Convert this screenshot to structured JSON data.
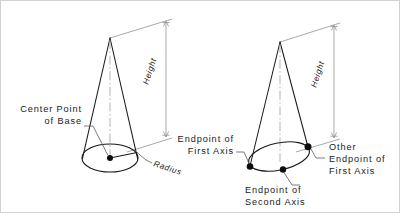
{
  "figure": {
    "type": "technical-line-diagram",
    "background_color": "#ffffff",
    "line_color": "#1a1a1a",
    "dimension_line_color": "#9a9a9a",
    "leader_line_color": "#5a5a5a",
    "frame_color": "#d2d2d2"
  },
  "left_cone": {
    "name": "cone-by-center-and-radius",
    "labels": {
      "height": "Height",
      "radius": "Radius",
      "center_point_line1": "Center Point",
      "center_point_line2": "of Base"
    }
  },
  "right_cone": {
    "name": "cone-by-elliptical-base-axes",
    "labels": {
      "height": "Height",
      "first_axis_endpoint_line1": "Endpoint of",
      "first_axis_endpoint_line2": "First Axis",
      "other_first_axis_endpoint_line1": "Other",
      "other_first_axis_endpoint_line2": "Endpoint of",
      "other_first_axis_endpoint_line3": "First Axis",
      "second_axis_endpoint_line1": "Endpoint of",
      "second_axis_endpoint_line2": "Second Axis"
    }
  }
}
